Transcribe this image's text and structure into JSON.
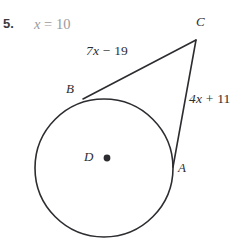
{
  "problem": {
    "number": "5.",
    "answer_prefix": "x",
    "answer_equals": "=",
    "answer_number": "10",
    "answer_full": "x = 10"
  },
  "figure": {
    "type": "circle-with-two-tangents",
    "segment_labels": {
      "tangent_bc": {
        "coefficient": "7",
        "variable": "x",
        "operator": "−",
        "constant": "19",
        "full": "7x − 19"
      },
      "tangent_ac": {
        "coefficient": "4",
        "variable": "x",
        "operator": "+",
        "constant": "11",
        "full": "4x + 11"
      }
    },
    "point_labels": {
      "center": "D",
      "tangent_point_upper": "B",
      "tangent_point_right": "A",
      "external_vertex": "C"
    },
    "colors": {
      "stroke": "#2d2d31",
      "answer_text": "#9a9a9f",
      "label_text": "#2d2d31",
      "background": "#ffffff"
    },
    "geometry": {
      "circle_center_x": 104,
      "circle_center_y": 168,
      "circle_radius": 69,
      "vertex_c_x": 196,
      "vertex_c_y": 40,
      "tangent_b_x": 83,
      "tangent_b_y": 99,
      "tangent_a_x": 173,
      "tangent_a_y": 167
    }
  }
}
